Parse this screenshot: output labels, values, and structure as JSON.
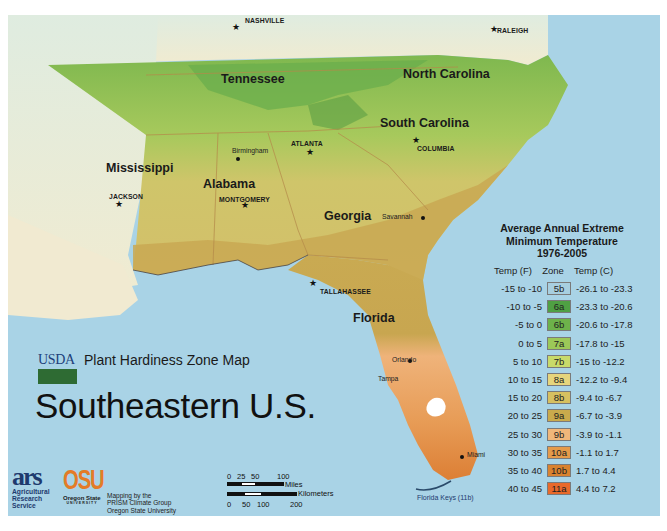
{
  "header": {
    "agency": "USDA",
    "map_name": "Plant Hardiness Zone Map",
    "region_title": "Southeastern U.S."
  },
  "states": [
    {
      "name": "Tennessee"
    },
    {
      "name": "North Carolina"
    },
    {
      "name": "South Carolina"
    },
    {
      "name": "Mississippi"
    },
    {
      "name": "Alabama"
    },
    {
      "name": "Georgia"
    },
    {
      "name": "Florida"
    }
  ],
  "capitals": [
    {
      "name": "NASHVILLE"
    },
    {
      "name": "RALEIGH"
    },
    {
      "name": "ATLANTA"
    },
    {
      "name": "COLUMBIA"
    },
    {
      "name": "JACKSON"
    },
    {
      "name": "MONTGOMERY"
    },
    {
      "name": "TALLAHASSEE"
    }
  ],
  "cities": [
    {
      "name": "Birmingham"
    },
    {
      "name": "Savannah"
    },
    {
      "name": "Orlando"
    },
    {
      "name": "Tampa"
    },
    {
      "name": "Miami"
    }
  ],
  "annotations": {
    "florida_keys": "Florida Keys (11b)"
  },
  "legend": {
    "title_line1": "Average Annual Extreme",
    "title_line2": "Minimum Temperature",
    "title_line3": "1976-2005",
    "col_f": "Temp (F)",
    "col_zone": "Zone",
    "col_c": "Temp (C)",
    "rows": [
      {
        "f": "-15 to -10",
        "zone": "5b",
        "c": "-26.1 to -23.3",
        "color": "#a8cfe0"
      },
      {
        "f": "-10 to -5",
        "zone": "6a",
        "c": "-23.3 to -20.6",
        "color": "#4fa043"
      },
      {
        "f": "-5 to 0",
        "zone": "6b",
        "c": "-20.6 to -17.8",
        "color": "#6db24a"
      },
      {
        "f": "0 to 5",
        "zone": "7a",
        "c": "-17.8 to -15",
        "color": "#9cc858"
      },
      {
        "f": "5 to 10",
        "zone": "7b",
        "c": "-15 to -12.2",
        "color": "#c8da6a"
      },
      {
        "f": "10 to 15",
        "zone": "8a",
        "c": "-12.2 to -9.4",
        "color": "#e6d57c"
      },
      {
        "f": "15 to 20",
        "zone": "8b",
        "c": "-9.4 to -6.7",
        "color": "#d7c060"
      },
      {
        "f": "20 to 25",
        "zone": "9a",
        "c": "-6.7 to -3.9",
        "color": "#c9aa4c"
      },
      {
        "f": "25 to 30",
        "zone": "9b",
        "c": "-3.9 to -1.1",
        "color": "#f0b77a"
      },
      {
        "f": "30 to 35",
        "zone": "10a",
        "c": "-1.1 to 1.7",
        "color": "#e59a4a"
      },
      {
        "f": "35 to 40",
        "zone": "10b",
        "c": "1.7 to 4.4",
        "color": "#d9822f"
      },
      {
        "f": "40 to 45",
        "zone": "11a",
        "c": "4.4 to 7.2",
        "color": "#e8692a"
      }
    ]
  },
  "scale_bar": {
    "miles_ticks": [
      "0",
      "25",
      "50",
      "100"
    ],
    "miles_label": "Miles",
    "km_label": "Kilometers",
    "km_ticks": [
      "0",
      "50",
      "100",
      "200"
    ]
  },
  "credits": {
    "ars_mark": "ars",
    "ars_line1": "Agricultural",
    "ars_line2": "Research",
    "ars_line3": "Service",
    "osu_mark": "OSU",
    "osu_sub": "Oregon State",
    "osu_sub2": "UNIVERSITY",
    "prism_line1": "Mapping by the",
    "prism_line2": "PRISM Climate Group",
    "prism_line3": "Oregon State University"
  },
  "colors": {
    "water": "#a9d3e6",
    "outside_land": "#ecebd4",
    "border": "#b58a4a"
  }
}
